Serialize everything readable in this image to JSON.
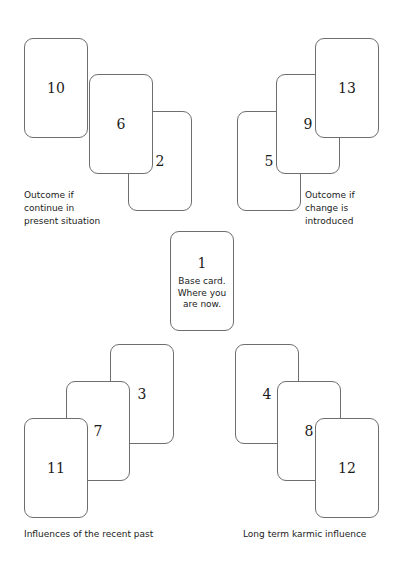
{
  "diagram": {
    "background_color": "#ffffff",
    "card_border_color": "#6e6e6e",
    "text_color": "#1b1b1b",
    "card_width": 64,
    "card_height": 100
  },
  "groups": {
    "top_left": {
      "caption": "Outcome if\ncontinue in\npresent situation",
      "cards": [
        {
          "number": "10",
          "x": 24,
          "y": 38,
          "z": 3
        },
        {
          "number": "6",
          "x": 89,
          "y": 74,
          "z": 2
        },
        {
          "number": "2",
          "x": 128,
          "y": 111,
          "z": 1
        }
      ]
    },
    "top_right": {
      "caption": "Outcome if\nchange is\nintroduced",
      "cards": [
        {
          "number": "13",
          "x": 315,
          "y": 38,
          "z": 3
        },
        {
          "number": "9",
          "x": 276,
          "y": 74,
          "z": 2
        },
        {
          "number": "5",
          "x": 237,
          "y": 111,
          "z": 1
        }
      ]
    },
    "center": {
      "card": {
        "number": "1",
        "text": "Base card.\nWhere you\nare now.",
        "x": 170,
        "y": 231,
        "z": 4
      }
    },
    "bottom_left": {
      "caption": "Influences of the recent past",
      "cards": [
        {
          "number": "3",
          "x": 110,
          "y": 344,
          "z": 1
        },
        {
          "number": "7",
          "x": 66,
          "y": 381,
          "z": 2
        },
        {
          "number": "11",
          "x": 24,
          "y": 418,
          "z": 3
        }
      ]
    },
    "bottom_right": {
      "caption": "Long term karmic influence",
      "cards": [
        {
          "number": "4",
          "x": 235,
          "y": 344,
          "z": 1
        },
        {
          "number": "8",
          "x": 277,
          "y": 381,
          "z": 2
        },
        {
          "number": "12",
          "x": 315,
          "y": 418,
          "z": 3
        }
      ]
    }
  },
  "captions": {
    "top_left": {
      "text": "Outcome if\ncontinue in\npresent situation",
      "x": 24,
      "y": 189
    },
    "top_right": {
      "text": "Outcome if\nchange is\nintroduced",
      "x": 305,
      "y": 189
    },
    "bottom_left": {
      "text": "Influences of the recent past",
      "x": 24,
      "y": 528
    },
    "bottom_right": {
      "text": "Long term karmic influence",
      "x": 243,
      "y": 528
    }
  }
}
